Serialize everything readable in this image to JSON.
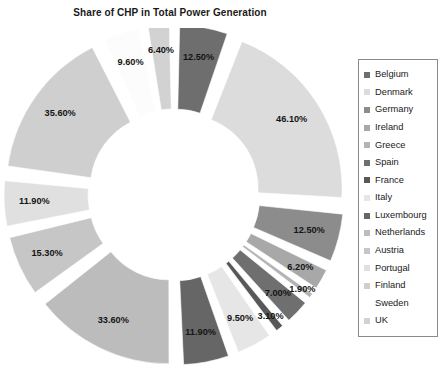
{
  "chart": {
    "title": "Share of CHP in Total Power Generation"
  },
  "legend": {
    "items": [
      {
        "label": "Belgium",
        "color": "#6e6e6e"
      },
      {
        "label": "Denmark",
        "color": "#dcdcdc"
      },
      {
        "label": "Germany",
        "color": "#8c8c8c"
      },
      {
        "label": "Ireland",
        "color": "#a8a8a8"
      },
      {
        "label": "Greece",
        "color": "#b4b4b4"
      },
      {
        "label": "Spain",
        "color": "#6f6f6f"
      },
      {
        "label": "France",
        "color": "#585858"
      },
      {
        "label": "Italy",
        "color": "#e6e6e6"
      },
      {
        "label": "Luxembourg",
        "color": "#666666"
      },
      {
        "label": "Netherlands",
        "color": "#bcbcbc"
      },
      {
        "label": "Austria",
        "color": "#c6c6c6"
      },
      {
        "label": "Portugal",
        "color": "#e0e0e0"
      },
      {
        "label": "Finland",
        "color": "#cfcfcf"
      },
      {
        "label": "Sweden",
        "color": "#fcfcfc"
      },
      {
        "label": "UK",
        "color": "#d2d2d2"
      }
    ]
  },
  "chart_data": {
    "type": "pie",
    "title": "Share of CHP in Total Power Generation",
    "subtype": "exploded-doughnut",
    "xlabel": "",
    "ylabel": "",
    "legend_position": "right",
    "grid": false,
    "value_suffix": "%",
    "categories": [
      "Belgium",
      "Denmark",
      "Germany",
      "Ireland",
      "Greece",
      "Spain",
      "France",
      "Italy",
      "Luxembourg",
      "Netherlands",
      "Austria",
      "Portugal",
      "Finland",
      "Sweden",
      "UK"
    ],
    "values": [
      12.5,
      46.1,
      12.5,
      6.2,
      1.9,
      7.0,
      3.1,
      9.5,
      11.9,
      33.6,
      15.3,
      11.9,
      35.6,
      9.6,
      6.4
    ],
    "labels": [
      "12.50%",
      "46.10%",
      "12.50%",
      "6.20%",
      "1.90%",
      "7.00%",
      "3.10%",
      "9.50%",
      "11.90%",
      "33.60%",
      "15.30%",
      "11.90%",
      "35.60%",
      "9.60%",
      "6.40%"
    ],
    "colors": [
      "#6e6e6e",
      "#dcdcdc",
      "#8c8c8c",
      "#a8a8a8",
      "#b4b4b4",
      "#6f6f6f",
      "#585858",
      "#e6e6e6",
      "#666666",
      "#bcbcbc",
      "#c6c6c6",
      "#e0e0e0",
      "#cfcfcf",
      "#fcfcfc",
      "#d2d2d2"
    ],
    "slices": [
      {
        "name": "Belgium",
        "value": 12.5,
        "label": "12.50%",
        "color": "#6e6e6e"
      },
      {
        "name": "Denmark",
        "value": 46.1,
        "label": "46.10%",
        "color": "#dcdcdc"
      },
      {
        "name": "Germany",
        "value": 12.5,
        "label": "12.50%",
        "color": "#8c8c8c"
      },
      {
        "name": "Ireland",
        "value": 6.2,
        "label": "6.20%",
        "color": "#a8a8a8"
      },
      {
        "name": "Greece",
        "value": 1.9,
        "label": "1.90%",
        "color": "#b4b4b4"
      },
      {
        "name": "Spain",
        "value": 7.0,
        "label": "7.00%",
        "color": "#6f6f6f"
      },
      {
        "name": "France",
        "value": 3.1,
        "label": "3.10%",
        "color": "#585858"
      },
      {
        "name": "Italy",
        "value": 9.5,
        "label": "9.50%",
        "color": "#e6e6e6"
      },
      {
        "name": "Luxembourg",
        "value": 11.9,
        "label": "11.90%",
        "color": "#666666"
      },
      {
        "name": "Netherlands",
        "value": 33.6,
        "label": "33.60%",
        "color": "#bcbcbc"
      },
      {
        "name": "Austria",
        "value": 15.3,
        "label": "15.30%",
        "color": "#c6c6c6"
      },
      {
        "name": "Portugal",
        "value": 11.9,
        "label": "11.90%",
        "color": "#e0e0e0"
      },
      {
        "name": "Finland",
        "value": 35.6,
        "label": "35.60%",
        "color": "#cfcfcf"
      },
      {
        "name": "Sweden",
        "value": 9.6,
        "label": "9.60%",
        "color": "#fcfcfc"
      },
      {
        "name": "UK",
        "value": 6.4,
        "label": "6.40%",
        "color": "#d2d2d2"
      }
    ]
  }
}
